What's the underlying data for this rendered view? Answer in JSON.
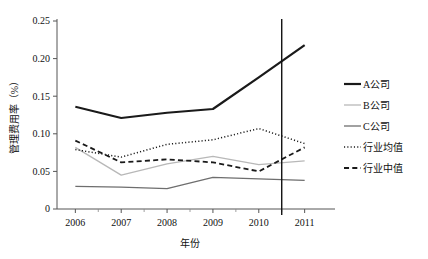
{
  "chart_data": {
    "type": "line",
    "title": "",
    "xlabel": "年份",
    "ylabel": "管理费用率（%）",
    "x": [
      2006,
      2007,
      2008,
      2009,
      2010,
      2011
    ],
    "xticklabels": [
      "2006",
      "2007",
      "2008",
      "2009",
      "2010",
      "2011"
    ],
    "yticklabels": [
      "0",
      "0.05",
      "0.10",
      "0.15",
      "0.20",
      "0.25"
    ],
    "yticks": [
      0,
      0.05,
      0.1,
      0.15,
      0.2,
      0.25
    ],
    "ylim": [
      0,
      0.25
    ],
    "xlim": [
      2005.6,
      2011.4
    ],
    "grid": false,
    "legend_position": "right",
    "annotations": [
      {
        "name": "vertical-reference-line",
        "x": 2010.5,
        "style": "solid",
        "color": "#111111"
      }
    ],
    "series": [
      {
        "name": "A公司",
        "values": [
          0.136,
          0.121,
          0.128,
          0.133,
          0.175,
          0.218
        ],
        "style": "solid",
        "width": 2.2,
        "color": "#1a1a1a"
      },
      {
        "name": "B公司",
        "values": [
          0.082,
          0.045,
          0.06,
          0.07,
          0.059,
          0.064
        ],
        "style": "solid",
        "width": 1.3,
        "color": "#b8b8b8"
      },
      {
        "name": "C公司",
        "values": [
          0.03,
          0.029,
          0.027,
          0.042,
          0.04,
          0.038
        ],
        "style": "solid",
        "width": 1.3,
        "color": "#6e6e6e"
      },
      {
        "name": "行业均值",
        "values": [
          0.079,
          0.069,
          0.086,
          0.092,
          0.107,
          0.087
        ],
        "style": "dotted",
        "width": 1.5,
        "color": "#1a1a1a"
      },
      {
        "name": "行业中值",
        "values": [
          0.091,
          0.062,
          0.066,
          0.062,
          0.05,
          0.082
        ],
        "style": "dashed",
        "width": 1.8,
        "color": "#1a1a1a"
      }
    ]
  },
  "legend": {
    "entries": [
      {
        "label": "A公司"
      },
      {
        "label": "B公司"
      },
      {
        "label": "C公司"
      },
      {
        "label": "行业均值"
      },
      {
        "label": "行业中值"
      }
    ]
  },
  "axes": {
    "x_title": "年份",
    "y_title": "管理费用率（%）"
  }
}
